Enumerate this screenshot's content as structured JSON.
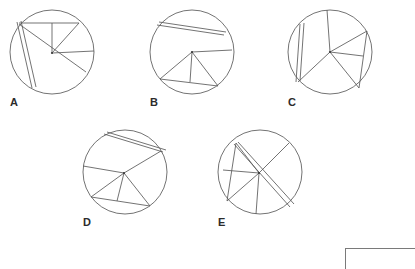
{
  "page": {
    "background_color": "#ffffff",
    "stroke_color": "#5a5a5a",
    "label_color": "#2b2b2b",
    "width": 414,
    "height": 268
  },
  "figures": [
    {
      "id": "A",
      "label": "A",
      "center": {
        "x": 52,
        "y": 52
      },
      "radius": 42,
      "hub": {
        "x": 52,
        "y": 53
      },
      "label_pos": {
        "x": 10,
        "y": 96
      },
      "segments": [
        {
          "name": "chord-upper-left-long",
          "x1": 19,
          "y1": 24,
          "x2": 86,
          "y2": 72
        },
        {
          "name": "chord-doubled-a",
          "x1": 17,
          "y1": 22,
          "x2": 32,
          "y2": 88
        },
        {
          "name": "chord-doubled-b",
          "x1": 21,
          "y1": 21,
          "x2": 36,
          "y2": 87
        },
        {
          "name": "chord-top-horizontal",
          "x1": 19,
          "y1": 23,
          "x2": 79,
          "y2": 23
        },
        {
          "name": "radius-up",
          "x1": 52,
          "y1": 53,
          "x2": 52,
          "y2": 23
        },
        {
          "name": "radius-right",
          "x1": 52,
          "y1": 53,
          "x2": 94,
          "y2": 51
        },
        {
          "name": "radius-upper-right",
          "x1": 52,
          "y1": 53,
          "x2": 79,
          "y2": 23
        }
      ]
    },
    {
      "id": "B",
      "label": "B",
      "center": {
        "x": 192,
        "y": 52
      },
      "radius": 42,
      "hub": {
        "x": 192,
        "y": 52
      },
      "label_pos": {
        "x": 150,
        "y": 96
      },
      "segments": [
        {
          "name": "chord-doubled-a",
          "x1": 159,
          "y1": 22,
          "x2": 226,
          "y2": 32
        },
        {
          "name": "chord-doubled-b",
          "x1": 157,
          "y1": 25,
          "x2": 224,
          "y2": 35
        },
        {
          "name": "chord-lower-left",
          "x1": 192,
          "y1": 52,
          "x2": 160,
          "y2": 79
        },
        {
          "name": "chord-bottom",
          "x1": 160,
          "y1": 79,
          "x2": 218,
          "y2": 86
        },
        {
          "name": "radius-right",
          "x1": 192,
          "y1": 52,
          "x2": 232,
          "y2": 50
        },
        {
          "name": "radius-down",
          "x1": 192,
          "y1": 52,
          "x2": 190,
          "y2": 82
        },
        {
          "name": "radius-lower-right",
          "x1": 192,
          "y1": 52,
          "x2": 218,
          "y2": 86
        }
      ]
    },
    {
      "id": "C",
      "label": "C",
      "center": {
        "x": 330,
        "y": 52
      },
      "radius": 42,
      "hub": {
        "x": 330,
        "y": 52
      },
      "label_pos": {
        "x": 288,
        "y": 96
      },
      "segments": [
        {
          "name": "chord-doubled-a",
          "x1": 300,
          "y1": 24,
          "x2": 296,
          "y2": 82
        },
        {
          "name": "chord-doubled-b",
          "x1": 304,
          "y1": 23,
          "x2": 300,
          "y2": 81
        },
        {
          "name": "radius-up",
          "x1": 330,
          "y1": 52,
          "x2": 327,
          "y2": 10
        },
        {
          "name": "radius-upper-right",
          "x1": 330,
          "y1": 52,
          "x2": 367,
          "y2": 31
        },
        {
          "name": "chord-right-vertical",
          "x1": 367,
          "y1": 31,
          "x2": 359,
          "y2": 88
        },
        {
          "name": "radius-right",
          "x1": 330,
          "y1": 52,
          "x2": 363,
          "y2": 56
        },
        {
          "name": "radius-lower-right",
          "x1": 330,
          "y1": 52,
          "x2": 359,
          "y2": 88
        },
        {
          "name": "radius-lower-left",
          "x1": 330,
          "y1": 52,
          "x2": 298,
          "y2": 82
        }
      ]
    },
    {
      "id": "D",
      "label": "D",
      "center": {
        "x": 125,
        "y": 172
      },
      "radius": 42,
      "hub": {
        "x": 124,
        "y": 173
      },
      "label_pos": {
        "x": 83,
        "y": 216
      },
      "segments": [
        {
          "name": "chord-doubled-a",
          "x1": 104,
          "y1": 134,
          "x2": 163,
          "y2": 152
        },
        {
          "name": "chord-doubled-b",
          "x1": 107,
          "y1": 132,
          "x2": 166,
          "y2": 150
        },
        {
          "name": "radius-upper-right-long",
          "x1": 124,
          "y1": 173,
          "x2": 161,
          "y2": 151
        },
        {
          "name": "radius-left",
          "x1": 124,
          "y1": 173,
          "x2": 83,
          "y2": 166
        },
        {
          "name": "radius-lower-left",
          "x1": 124,
          "y1": 173,
          "x2": 91,
          "y2": 197
        },
        {
          "name": "chord-bottom",
          "x1": 91,
          "y1": 197,
          "x2": 150,
          "y2": 206
        },
        {
          "name": "radius-down",
          "x1": 124,
          "y1": 173,
          "x2": 117,
          "y2": 201
        },
        {
          "name": "radius-lower-right",
          "x1": 124,
          "y1": 173,
          "x2": 150,
          "y2": 206
        }
      ]
    },
    {
      "id": "E",
      "label": "E",
      "center": {
        "x": 260,
        "y": 172
      },
      "radius": 42,
      "hub": {
        "x": 259,
        "y": 173
      },
      "label_pos": {
        "x": 218,
        "y": 216
      },
      "segments": [
        {
          "name": "chord-doubled-a",
          "x1": 234,
          "y1": 144,
          "x2": 290,
          "y2": 207
        },
        {
          "name": "chord-doubled-b",
          "x1": 238,
          "y1": 142,
          "x2": 294,
          "y2": 204
        },
        {
          "name": "radius-upper-left",
          "x1": 259,
          "y1": 173,
          "x2": 236,
          "y2": 143
        },
        {
          "name": "chord-left-vertical",
          "x1": 236,
          "y1": 143,
          "x2": 227,
          "y2": 201
        },
        {
          "name": "radius-left",
          "x1": 259,
          "y1": 173,
          "x2": 223,
          "y2": 170
        },
        {
          "name": "radius-lower-left",
          "x1": 259,
          "y1": 173,
          "x2": 227,
          "y2": 201
        },
        {
          "name": "radius-down",
          "x1": 259,
          "y1": 173,
          "x2": 256,
          "y2": 214
        },
        {
          "name": "radius-upper-right",
          "x1": 259,
          "y1": 173,
          "x2": 289,
          "y2": 143
        }
      ]
    }
  ],
  "corner_frame": {
    "name": "corner-frame",
    "x": 345,
    "y": 248,
    "width": 69,
    "height": 20
  }
}
